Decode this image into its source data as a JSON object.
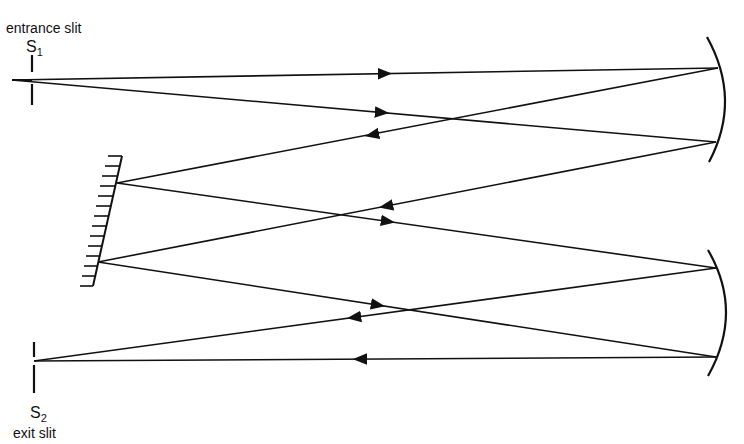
{
  "labels": {
    "entrance_slit": "entrance slit",
    "exit_slit": "exit slit",
    "s1_letter": "S",
    "s1_sub": "1",
    "s2_letter": "S",
    "s2_sub": "2"
  },
  "components": [
    {
      "name": "entrance-slit",
      "label": "entrance slit S1"
    },
    {
      "name": "collimating-mirror",
      "type": "concave mirror"
    },
    {
      "name": "diffraction-grating",
      "type": "plane reflection grating"
    },
    {
      "name": "focusing-mirror",
      "type": "concave mirror"
    },
    {
      "name": "exit-slit",
      "label": "exit slit S2"
    }
  ],
  "colors": {
    "line": "#111111",
    "background": "#ffffff"
  }
}
